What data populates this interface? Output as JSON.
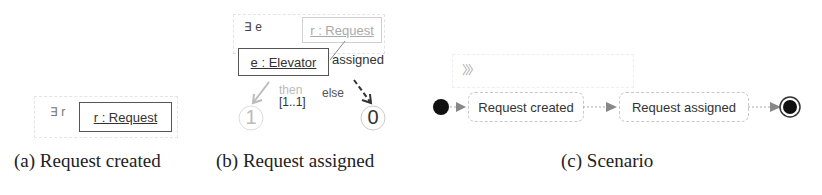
{
  "panel_a": {
    "quantifier": "∃ r",
    "object_label": "r : Request",
    "caption": "(a)  Request created"
  },
  "panel_b": {
    "quantifier": "∃ e",
    "request_object_label": "r : Request",
    "elevator_object_label": "e : Elevator",
    "link_label": "assigned",
    "then_label": "then",
    "multiplicity": "[1..1]",
    "else_label": "else",
    "then_result": "1",
    "else_result": "0",
    "caption": "(b)  Request assigned"
  },
  "panel_c": {
    "chevron_glyph": "〉〉〉",
    "states": [
      "Request created",
      "Request assigned"
    ],
    "caption": "(c)  Scenario"
  }
}
